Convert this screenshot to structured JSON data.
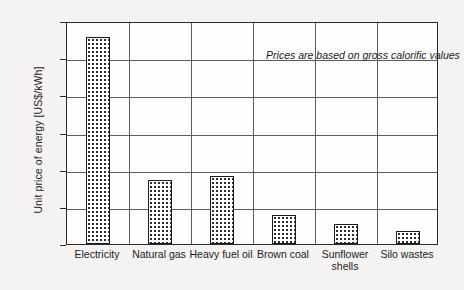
{
  "chart_data": {
    "type": "bar",
    "title": "",
    "subtitle": "",
    "xlabel": "",
    "ylabel": "Unit price of energy [US$/kWh]",
    "categories": [
      "Electricity",
      "Natural gas",
      "Heavy fuel oil",
      "Brown coal",
      "Sunflower shells",
      "Silo wastes"
    ],
    "category_lines": [
      [
        "Electricity"
      ],
      [
        "Natural gas"
      ],
      [
        "Heavy fuel oil"
      ],
      [
        "Brown coal"
      ],
      [
        "Sunflower",
        "shells"
      ],
      [
        "Silo wastes"
      ]
    ],
    "values": [
      0.0556,
      0.0172,
      0.0182,
      0.0078,
      0.0053,
      0.0035
    ],
    "ylim": [
      0.0,
      0.06
    ],
    "ytick_values": [
      0.0,
      0.01,
      0.02,
      0.03,
      0.04,
      0.05,
      0.06
    ],
    "ytick_labels": [
      "0.00",
      "0.01",
      "0.02",
      "0.03",
      "0.04",
      "0.05",
      "0.06"
    ],
    "grid": "horizontal-and-vertical",
    "legend": "none",
    "annotations": [
      "Prices are based on gross calorific values"
    ],
    "bar_fill": "dotted-pattern",
    "bar_outline_color": "#1a1a1a",
    "grid_color": "#5d5d5d",
    "axis_color": "#2b2b2b",
    "background_color": "#f4f3f1",
    "plot_background_color": "#fdfdfc"
  },
  "annotation": {
    "text": "Prices are based on gross calorific values"
  }
}
